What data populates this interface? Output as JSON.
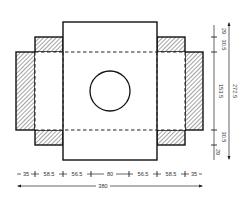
{
  "diagram": {
    "colors": {
      "line": "#111111",
      "hatch": "#333333",
      "text": "#333333"
    },
    "horizontal_dimensions": {
      "segments": [
        "35",
        "58.5",
        "56.5",
        "80",
        "56.5",
        "58.5",
        "35"
      ],
      "total": "380"
    },
    "vertical_dimensions": {
      "segments": [
        "29",
        "30.5",
        "153.5",
        "30.5",
        "29"
      ],
      "total": "272.5"
    },
    "parts": {
      "center_panel": "base panel with circular window",
      "side_panels": "hatched glue panels",
      "corner_flaps": "hatched corner flaps",
      "fold_lines": "dashed fold lines"
    }
  }
}
